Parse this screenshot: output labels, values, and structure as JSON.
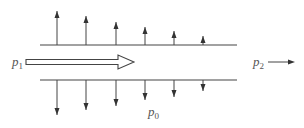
{
  "diagram": {
    "colors": {
      "line": "#444444",
      "text": "#555555",
      "background": "#ffffff"
    },
    "walls": {
      "top": {
        "x1": 40,
        "x2": 237,
        "y": 45
      },
      "bottom": {
        "x1": 40,
        "x2": 237,
        "y": 80
      }
    },
    "up_arrows": [
      {
        "x": 57,
        "tip_y": 11
      },
      {
        "x": 86,
        "tip_y": 16
      },
      {
        "x": 116,
        "tip_y": 22
      },
      {
        "x": 145,
        "tip_y": 27
      },
      {
        "x": 174,
        "tip_y": 31
      },
      {
        "x": 203,
        "tip_y": 36
      }
    ],
    "down_arrows": [
      {
        "x": 57,
        "tip_y": 115
      },
      {
        "x": 86,
        "tip_y": 110
      },
      {
        "x": 116,
        "tip_y": 106
      },
      {
        "x": 145,
        "tip_y": 100
      },
      {
        "x": 174,
        "tip_y": 97
      },
      {
        "x": 203,
        "tip_y": 91
      }
    ],
    "labels": {
      "inlet": {
        "base": "p",
        "sub": "1"
      },
      "outlet": {
        "base": "p",
        "sub": "2"
      },
      "ambient": {
        "base": "p",
        "sub": "0"
      }
    }
  }
}
